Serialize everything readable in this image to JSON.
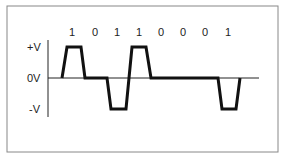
{
  "diagram": {
    "title": "",
    "bits": [
      "1",
      "0",
      "1",
      "1",
      "0",
      "0",
      "0",
      "1"
    ],
    "levels": {
      "positive": "+V",
      "zero": "0V",
      "negative": "-V"
    },
    "encoding_note": "Bipolar (AMI) line coding waveform: each 1 alternates between +V and -V, each 0 stays at 0V",
    "colors": {
      "frame": "#888888",
      "axis": "#222222",
      "waveform": "#111111",
      "background": "#ffffff"
    }
  }
}
